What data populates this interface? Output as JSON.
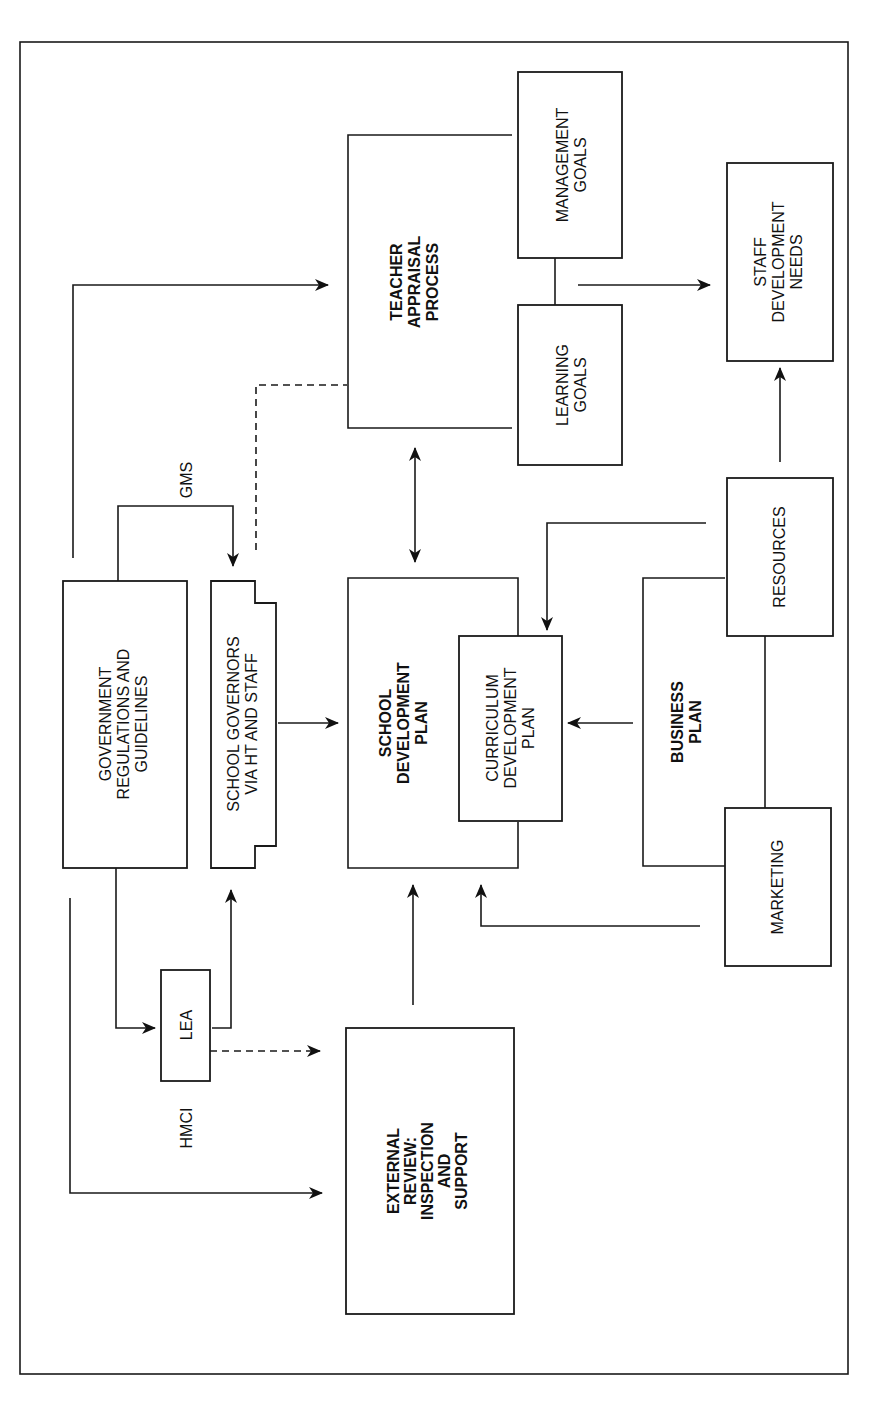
{
  "diagram": {
    "orientation": "rotated 90 degrees counter-clockwise",
    "nodes": {
      "teacher_appraisal": [
        "TEACHER",
        "APPRAISAL",
        "PROCESS"
      ],
      "management_goals": [
        "MANAGEMENT",
        "GOALS"
      ],
      "learning_goals": [
        "LEARNING",
        "GOALS"
      ],
      "staff_development": [
        "STAFF",
        "DEVELOPMENT",
        "NEEDS"
      ],
      "government": [
        "GOVERNMENT",
        "REGULATIONS AND",
        "GUIDELINES"
      ],
      "governors": [
        "SCHOOL GOVERNORS",
        "VIA HT AND STAFF"
      ],
      "school_dev_plan": [
        "SCHOOL",
        "DEVELOPMENT",
        "PLAN"
      ],
      "curriculum_plan": [
        "CURRICULUM",
        "DEVELOPMENT",
        "PLAN"
      ],
      "business_plan": [
        "BUSINESS",
        "PLAN"
      ],
      "resources": [
        "RESOURCES"
      ],
      "marketing": [
        "MARKETING"
      ],
      "lea": [
        "LEA"
      ],
      "external_review": [
        "EXTERNAL",
        "REVIEW:",
        "INSPECTION",
        "AND",
        "SUPPORT"
      ]
    },
    "labels": {
      "gms": "GMS",
      "hmci": "HMCI"
    },
    "edges": [
      {
        "from": "government",
        "to": "teacher_appraisal",
        "style": "solid"
      },
      {
        "from": "government",
        "to": "governors",
        "label": "GMS",
        "style": "solid"
      },
      {
        "from": "government",
        "to": "lea",
        "style": "solid"
      },
      {
        "from": "government",
        "to": "external_review",
        "label": "HMCI",
        "style": "solid"
      },
      {
        "from": "governors",
        "to": "teacher_appraisal",
        "style": "dashed"
      },
      {
        "from": "governors",
        "to": "school_dev_plan",
        "style": "solid"
      },
      {
        "from": "lea",
        "to": "governors",
        "style": "solid"
      },
      {
        "from": "lea",
        "to": "external_review",
        "style": "dashed"
      },
      {
        "from": "external_review",
        "to": "school_dev_plan",
        "style": "solid"
      },
      {
        "from": "school_dev_plan",
        "to": "teacher_appraisal",
        "style": "bidirectional"
      },
      {
        "from": "teacher_appraisal",
        "to": "staff_development",
        "style": "solid"
      },
      {
        "from": "resources",
        "to": "staff_development",
        "style": "solid"
      },
      {
        "from": "resources",
        "to": "curriculum_plan",
        "style": "solid"
      },
      {
        "from": "business_plan",
        "to": "curriculum_plan",
        "style": "solid"
      },
      {
        "from": "marketing",
        "to": "school_dev_plan",
        "style": "solid"
      }
    ]
  }
}
